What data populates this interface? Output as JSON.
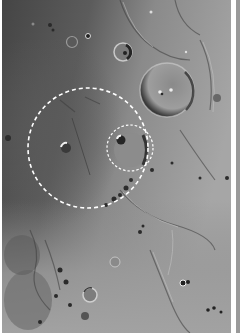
{
  "image": {
    "subject": "lunar surface photograph",
    "width": 240,
    "height": 333,
    "photo_region": {
      "x": 2,
      "y": 0,
      "width": 229,
      "height": 333
    },
    "colors": {
      "mare_dark": "#4a4a4a",
      "mare_mid": "#6e6e6e",
      "highland": "#a8a8a8",
      "highland_bright": "#c4c4c4",
      "border": "#ffffff",
      "edge_strip": "#9a9a9a",
      "annotation": "#ffffff"
    }
  },
  "annotations": {
    "large_circle": {
      "cx": 88,
      "cy": 148,
      "r": 60,
      "style": "dashed",
      "color": "#ffffff"
    },
    "small_circle": {
      "cx": 130,
      "cy": 148,
      "r": 23,
      "style": "dashed",
      "color": "#ffffff"
    }
  },
  "features": {
    "craters": [
      {
        "cx": 167,
        "cy": 90,
        "r": 27
      },
      {
        "cx": 123,
        "cy": 52,
        "r": 9
      },
      {
        "cx": 72,
        "cy": 42,
        "r": 6
      },
      {
        "cx": 88,
        "cy": 36,
        "r": 3
      },
      {
        "cx": 66,
        "cy": 148,
        "r": 5
      },
      {
        "cx": 121,
        "cy": 140,
        "r": 5
      },
      {
        "cx": 90,
        "cy": 295,
        "r": 7
      },
      {
        "cx": 115,
        "cy": 262,
        "r": 5
      },
      {
        "cx": 183,
        "cy": 283,
        "r": 4
      },
      {
        "cx": 50,
        "cy": 25,
        "r": 3
      },
      {
        "cx": 8,
        "cy": 138,
        "r": 3
      }
    ]
  }
}
